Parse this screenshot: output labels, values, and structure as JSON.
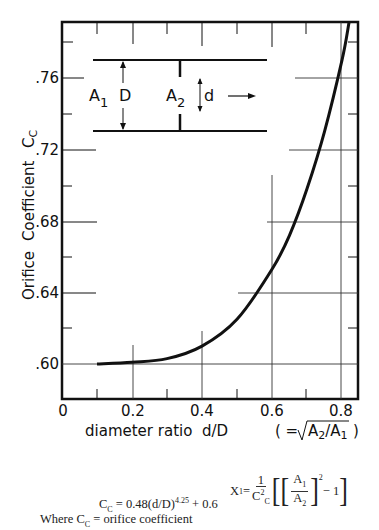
{
  "chart_data": {
    "type": "line",
    "title": "",
    "xlabel": "diameter ratio d/D (= √(A2/A1))",
    "ylabel": "Orifice Coefficient C_C",
    "xlim": [
      0,
      0.85
    ],
    "ylim": [
      0.58,
      0.79
    ],
    "x_ticks": [
      "0",
      "0.2",
      "0.4",
      "0.6",
      "0.8"
    ],
    "y_ticks": [
      ".60",
      ".64",
      ".68",
      ".72",
      ".76"
    ],
    "grid": "partial",
    "legend": "none",
    "series": [
      {
        "name": "C_C = 0.48(d/D)^4.25 + 0.6",
        "x": [
          0.1,
          0.2,
          0.3,
          0.4,
          0.5,
          0.6,
          0.65,
          0.7,
          0.75,
          0.8,
          0.82
        ],
        "y": [
          0.6,
          0.601,
          0.603,
          0.61,
          0.625,
          0.653,
          0.672,
          0.698,
          0.73,
          0.77,
          0.791
        ]
      }
    ],
    "annotations": [
      "A1",
      "D",
      "A2",
      "d",
      "flow-arrow"
    ]
  },
  "labels": {
    "y_axis_word1": "Orifice",
    "y_axis_word2": "Coefficient",
    "y_axis_symbol": "C",
    "y_axis_symbol_sub": "C",
    "x_axis_text": "diameter ratio  d/D",
    "x_axis_eq": "( =",
    "x_axis_sqrt_num": "A",
    "x_axis_sqrt_num_sub": "2",
    "x_axis_sqrt_den": "A",
    "x_axis_sqrt_den_sub": "1",
    "x_axis_close": ")",
    "diagram_A1": "A",
    "diagram_A1_sub": "1",
    "diagram_D": "D",
    "diagram_A2": "A",
    "diagram_A2_sub": "2",
    "diagram_d": "d"
  },
  "formulas": {
    "cc_lhs": "C",
    "cc_lhs_sub": "C",
    "cc_rhs_a": " = 0.48(d/D)",
    "cc_exp": "4.25",
    "cc_rhs_b": " + 0.6",
    "where_a": "Where C",
    "where_sub": "C",
    "where_b": " = orifice coefficient",
    "x1_lhs": "X",
    "x1_lhs_sub": "1",
    "x1_eq": " = ",
    "x1_frac_num": "1",
    "x1_frac_den": "C",
    "x1_frac_den_sup": "2",
    "x1_frac_den_sub": "C",
    "x1_inner_num": "A",
    "x1_inner_num_sub": "1",
    "x1_inner_den": "A",
    "x1_inner_den_sub": "2",
    "x1_power": "2",
    "x1_minus": " − 1"
  }
}
